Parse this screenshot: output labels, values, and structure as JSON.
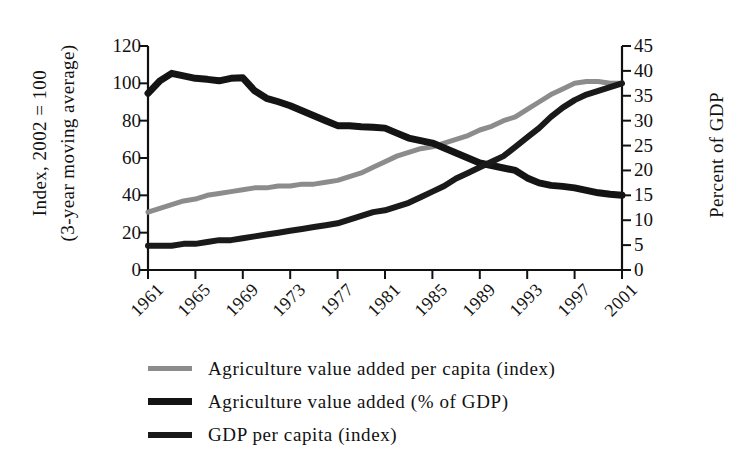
{
  "axes": {
    "left_title_line1": "Index, 2002 = 100",
    "left_title_line2": "(3-year moving average)",
    "right_title": "Percent of GDP",
    "left_ticks": [
      "120",
      "100",
      "80",
      "60",
      "40",
      "20",
      "0"
    ],
    "right_ticks": [
      "45",
      "40",
      "35",
      "30",
      "25",
      "20",
      "15",
      "10",
      "5",
      "0"
    ],
    "x_ticks": [
      "1961",
      "1965",
      "1969",
      "1973",
      "1977",
      "1981",
      "1985",
      "1989",
      "1993",
      "1997",
      "2001"
    ]
  },
  "legend": {
    "items": [
      {
        "label": "Agriculture value added per capita (index)",
        "color": "#8c8c8c",
        "width": 5
      },
      {
        "label": "Agriculture value added (% of GDP)",
        "color": "#141414",
        "width": 7
      },
      {
        "label": "GDP per capita (index)",
        "color": "#1a1a1a",
        "width": 6
      }
    ]
  },
  "chart_data": {
    "type": "line",
    "title": "",
    "xlabel": "",
    "ylabel": "Index, 2002 = 100 (3-year moving average)",
    "y2label": "Percent of GDP",
    "xlim": [
      1961,
      2001
    ],
    "ylim": [
      0,
      120
    ],
    "y2lim": [
      0,
      45
    ],
    "grid": false,
    "legend_position": "below",
    "x": [
      1961,
      1962,
      1963,
      1964,
      1965,
      1966,
      1967,
      1968,
      1969,
      1970,
      1971,
      1972,
      1973,
      1974,
      1975,
      1976,
      1977,
      1978,
      1979,
      1980,
      1981,
      1982,
      1983,
      1984,
      1985,
      1986,
      1987,
      1988,
      1989,
      1990,
      1991,
      1992,
      1993,
      1994,
      1995,
      1996,
      1997,
      1998,
      1999,
      2000,
      2001
    ],
    "series": [
      {
        "name": "Agriculture value added per capita (index)",
        "axis": "left",
        "color": "#8c8c8c",
        "units": "index",
        "values": [
          31,
          33,
          35,
          37,
          38,
          40,
          41,
          42,
          43,
          44,
          44,
          45,
          45,
          46,
          46,
          47,
          48,
          50,
          52,
          55,
          58,
          61,
          63,
          65,
          66,
          68,
          70,
          72,
          75,
          77,
          80,
          82,
          86,
          90,
          94,
          97,
          100,
          101,
          101,
          100,
          100
        ]
      },
      {
        "name": "Agriculture value added (% of GDP)",
        "axis": "right",
        "color": "#141414",
        "units": "percent",
        "values": [
          35.5,
          38.0,
          39.5,
          39.0,
          38.5,
          38.3,
          38.0,
          38.5,
          38.6,
          36.0,
          34.5,
          33.8,
          33.0,
          32.0,
          31.0,
          30.0,
          29.0,
          29.0,
          28.8,
          28.7,
          28.5,
          27.5,
          26.5,
          26.0,
          25.5,
          24.5,
          23.5,
          22.5,
          21.5,
          21.0,
          20.5,
          20.0,
          18.5,
          17.5,
          17.0,
          16.8,
          16.5,
          16.0,
          15.5,
          15.2,
          15.0
        ]
      },
      {
        "name": "GDP per capita (index)",
        "axis": "left",
        "color": "#1a1a1a",
        "units": "index",
        "values": [
          13,
          13,
          13,
          14,
          14,
          15,
          16,
          16,
          17,
          18,
          19,
          20,
          21,
          22,
          23,
          24,
          25,
          27,
          29,
          31,
          32,
          34,
          36,
          39,
          42,
          45,
          49,
          52,
          55,
          58,
          61,
          66,
          71,
          76,
          82,
          87,
          91,
          94,
          96,
          98,
          100
        ]
      }
    ],
    "annotations": [
      {
        "text": "agriculture share and GDP per capita cross",
        "x": 1991,
        "y_index": 57,
        "y_percent": 21
      }
    ]
  }
}
